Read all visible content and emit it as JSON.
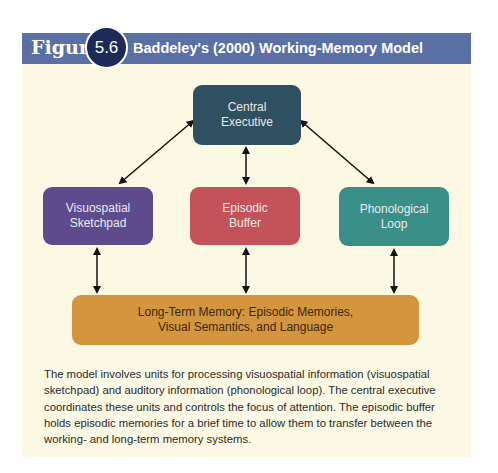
{
  "figure": {
    "label": "Figure",
    "number": "5.6",
    "title": "Baddeley's (2000) Working-Memory Model"
  },
  "colors": {
    "header": "#5a6fa3",
    "badge": "#1e2a57",
    "panel": "#fbf8e3",
    "central_executive": "#2f5060",
    "visuospatial_sketchpad": "#5d4b8e",
    "episodic_buffer": "#c4525a",
    "phonological_loop": "#3a8f89",
    "long_term_memory": "#d4953f"
  },
  "diagram": {
    "nodes": {
      "central_executive": {
        "line1": "Central",
        "line2": "Executive"
      },
      "visuospatial_sketchpad": {
        "line1": "Visuospatial",
        "line2": "Sketchpad"
      },
      "episodic_buffer": {
        "line1": "Episodic",
        "line2": "Buffer"
      },
      "phonological_loop": {
        "line1": "Phonological",
        "line2": "Loop"
      },
      "long_term_memory": {
        "line1": "Long-Term Memory: Episodic Memories,",
        "line2": "Visual Semantics, and Language"
      }
    },
    "edges": [
      {
        "from": "central_executive",
        "to": "visuospatial_sketchpad",
        "type": "bidirectional"
      },
      {
        "from": "central_executive",
        "to": "episodic_buffer",
        "type": "bidirectional"
      },
      {
        "from": "central_executive",
        "to": "phonological_loop",
        "type": "bidirectional"
      },
      {
        "from": "visuospatial_sketchpad",
        "to": "long_term_memory",
        "type": "bidirectional"
      },
      {
        "from": "episodic_buffer",
        "to": "long_term_memory",
        "type": "bidirectional"
      },
      {
        "from": "phonological_loop",
        "to": "long_term_memory",
        "type": "bidirectional"
      }
    ]
  },
  "caption": "The model involves units for processing visuospatial information (visuospatial sketchpad) and auditory information (phonological loop). The central executive coordinates these units and controls the focus of attention. The episodic buffer holds episodic memories for a brief time to allow them to transfer between the working- and long-term memory systems."
}
